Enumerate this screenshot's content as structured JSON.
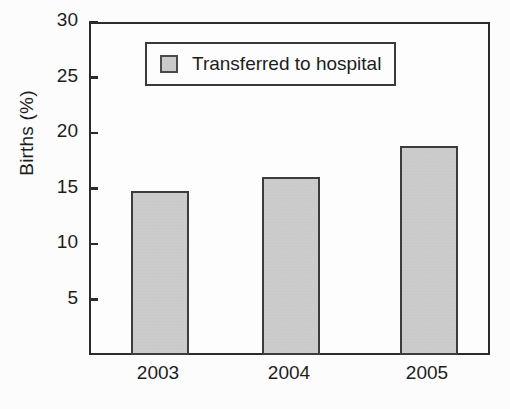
{
  "chart_data": {
    "type": "bar",
    "title": "",
    "xlabel": "",
    "ylabel": "Births (%)",
    "categories": [
      "2003",
      "2004",
      "2005"
    ],
    "values": [
      15.0,
      16.2,
      19.0
    ],
    "series": [
      {
        "name": "Transferred to hospital",
        "values": [
          15.0,
          16.2,
          19.0
        ]
      }
    ],
    "ylim": [
      0,
      30
    ],
    "yticks": [
      5,
      10,
      15,
      20,
      25,
      30
    ],
    "ytick_labels": [
      "5",
      "10",
      "15",
      "20",
      "25",
      "30"
    ],
    "grid": false,
    "legend": {
      "position": "top-center",
      "entries": [
        "Transferred to hospital"
      ]
    },
    "colors": {
      "bar_fill": "#cbcbcb",
      "bar_edge": "#3c3c3c",
      "axis": "#2b2b2b",
      "text": "#1d1d1d",
      "background": "#ffffff"
    }
  },
  "axes": {
    "y_title": "Births (%)",
    "y_ticks": [
      {
        "label": "30",
        "value": 30
      },
      {
        "label": "25",
        "value": 25
      },
      {
        "label": "20",
        "value": 20
      },
      {
        "label": "15",
        "value": 15
      },
      {
        "label": "10",
        "value": 10
      },
      {
        "label": "5",
        "value": 5
      }
    ],
    "x_ticks": [
      {
        "label": "2003"
      },
      {
        "label": "2004"
      },
      {
        "label": "2005"
      }
    ]
  },
  "legend": {
    "label": "Transferred to hospital"
  }
}
